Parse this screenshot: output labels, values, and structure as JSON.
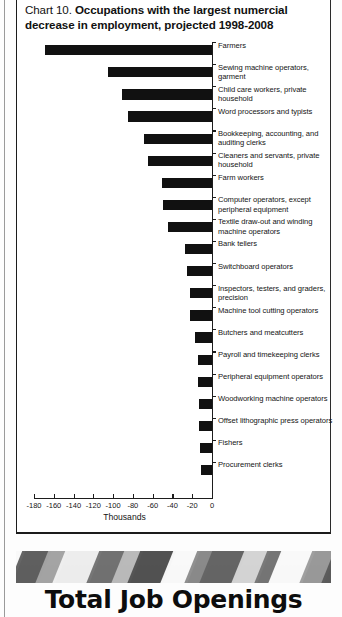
{
  "chart_panel": {
    "title_prefix": "Chart 10. ",
    "title_main": "Occupations with the largest numercial decrease in employment, projected 1998-2008"
  },
  "footer": {
    "heading": "Total Job Openings"
  },
  "chart_data": {
    "type": "bar",
    "orientation": "horizontal",
    "title": "Chart 10. Occupations with the largest numercial decrease in employment, projected 1998-2008",
    "xlabel": "Thousands",
    "ylabel": "",
    "xlim": [
      -180,
      0
    ],
    "xticks": [
      -180,
      -160,
      -140,
      -120,
      -100,
      -80,
      -60,
      -40,
      -20,
      0
    ],
    "xtick_labels": [
      "-180",
      "-160",
      "-140",
      "-120",
      "-100",
      "-80",
      "-60",
      "-40",
      "-20",
      "0"
    ],
    "grid": false,
    "legend": false,
    "bar_color": "#111111",
    "categories": [
      "Farmers",
      "Sewing machine operators, garment",
      "Child care workers, private household",
      "Word processors and typists",
      "Bookkeeping, accounting, and auditing clerks",
      "Cleaners and servants, private household",
      "Farm workers",
      "Computer operators, except peripheral equipment",
      "Textile draw-out and winding machine operators",
      "Bank tellers",
      "Switchboard operators",
      "Inspectors, testers, and graders, precision",
      "Machine tool cutting operators",
      "Butchers and meatcutters",
      "Payroll and timekeeping clerks",
      "Peripheral equipment operators",
      "Woodworking machine operators",
      "Offset lithographic press operators",
      "Fishers",
      "Procurement clerks"
    ],
    "values": [
      -169,
      -105,
      -91,
      -85,
      -69,
      -65,
      -51,
      -50,
      -44,
      -27,
      -25,
      -22,
      -22,
      -17,
      -14,
      -14,
      -13,
      -13,
      -12,
      -11
    ]
  }
}
